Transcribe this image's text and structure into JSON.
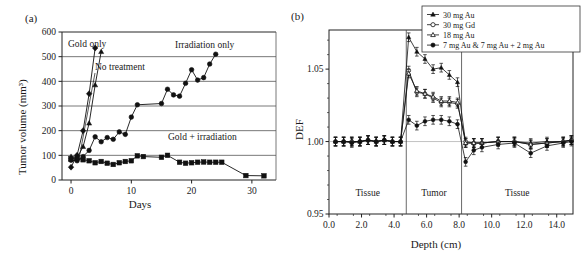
{
  "figure": {
    "panels": [
      {
        "label": "(a)",
        "xlabel": "Days",
        "ylabel": "Tumor volume (mm³)",
        "annotations": [
          "Gold only",
          "No treatment",
          "Irradiation only",
          "Gold + irradiation"
        ]
      },
      {
        "label": "(b)",
        "xlabel": "Depth (cm)",
        "ylabel": "DEF",
        "regions": [
          "Tissue",
          "Tumor",
          "Tissue"
        ],
        "legend": [
          "30 mg Au",
          "30 mg Gd",
          "18 mg Au",
          "7 mg Au & 7 mg Au + 2 mg Au"
        ]
      }
    ]
  },
  "chart_data": [
    {
      "type": "line",
      "panel": "(a)",
      "title": "",
      "xlabel": "Days",
      "ylabel": "Tumor volume (mm³)",
      "xlim": [
        -1.5,
        34
      ],
      "ylim": [
        0,
        600
      ],
      "xticks": [
        0,
        10,
        20,
        30
      ],
      "yticks": [
        0,
        100,
        200,
        300,
        400,
        500,
        600
      ],
      "grid": "horizontal",
      "series": [
        {
          "name": "Gold only",
          "marker": "filled-diamond",
          "x": [
            0,
            1,
            2,
            3,
            4
          ],
          "y": [
            52,
            100,
            200,
            350,
            535
          ]
        },
        {
          "name": "No treatment",
          "marker": "filled-triangle",
          "x": [
            0,
            1,
            2,
            3,
            4,
            5
          ],
          "y": [
            95,
            90,
            135,
            230,
            385,
            520
          ]
        },
        {
          "name": "Irradiation only",
          "marker": "filled-circle",
          "x": [
            0,
            1,
            2,
            3,
            4,
            5,
            6,
            7,
            8,
            9,
            10,
            11,
            15,
            16,
            17,
            18,
            19,
            20,
            21,
            22,
            23,
            24
          ],
          "y": [
            80,
            78,
            95,
            120,
            175,
            155,
            172,
            165,
            195,
            185,
            255,
            305,
            310,
            368,
            345,
            340,
            392,
            447,
            405,
            415,
            470,
            510
          ]
        },
        {
          "name": "Gold + irradiation",
          "marker": "filled-square",
          "x": [
            0,
            1,
            2,
            3,
            4,
            5,
            6,
            7,
            8,
            9,
            10,
            11,
            12,
            15,
            16,
            18,
            19,
            20,
            21,
            22,
            23,
            24,
            25,
            29,
            32
          ],
          "y": [
            85,
            88,
            82,
            78,
            70,
            75,
            68,
            63,
            70,
            75,
            78,
            98,
            95,
            92,
            100,
            72,
            68,
            70,
            72,
            73,
            72,
            72,
            72,
            18,
            17
          ]
        }
      ]
    },
    {
      "type": "line",
      "panel": "(b)",
      "title": "",
      "xlabel": "Depth (cm)",
      "ylabel": "DEF",
      "xlim": [
        0,
        15
      ],
      "ylim": [
        0.95,
        1.077
      ],
      "xticks": [
        0.0,
        2.0,
        4.0,
        6.0,
        8.0,
        10.0,
        12.0,
        14.0
      ],
      "yticks": [
        0.95,
        1.0,
        1.05
      ],
      "ytick_labels": [
        "0.95",
        "1.00",
        "1.05"
      ],
      "grid": "none",
      "tumor_region": [
        4.75,
        8.15
      ],
      "regions": [
        {
          "name": "Tissue",
          "range": [
            0.0,
            4.75
          ]
        },
        {
          "name": "Tumor",
          "range": [
            4.75,
            8.15
          ]
        },
        {
          "name": "Tissue",
          "range": [
            8.15,
            15.0
          ]
        }
      ],
      "series": [
        {
          "name": "30 mg Au",
          "marker": "filled-triangle",
          "x": [
            0.4,
            0.9,
            1.4,
            1.9,
            2.4,
            2.9,
            3.4,
            3.9,
            4.4,
            4.9,
            5.4,
            5.9,
            6.4,
            6.9,
            7.4,
            7.9,
            8.4,
            8.9,
            9.4,
            10.4,
            11.4,
            12.4,
            13.4,
            14.4,
            14.9
          ],
          "y": [
            1.0,
            1.0,
            1.0,
            1.0,
            1.001,
            1.0,
            1.001,
            1.0,
            1.0,
            1.072,
            1.062,
            1.057,
            1.05,
            1.051,
            1.046,
            1.041,
            0.999,
            0.999,
            0.999,
            1.0,
            1.0,
            0.999,
            1.0,
            1.0,
            1.001
          ],
          "error": 0.003
        },
        {
          "name": "30 mg Gd",
          "marker": "open-circle",
          "x": [
            0.4,
            0.9,
            1.4,
            1.9,
            2.4,
            2.9,
            3.4,
            3.9,
            4.4,
            4.9,
            5.4,
            5.9,
            6.4,
            6.9,
            7.4,
            7.9,
            8.4,
            8.9,
            9.4,
            10.4,
            11.4,
            12.4,
            13.4,
            14.4,
            14.9
          ],
          "y": [
            1.0,
            1.0,
            1.0,
            1.0,
            1.001,
            1.0,
            1.001,
            1.0,
            1.0,
            1.049,
            1.034,
            1.033,
            1.03,
            1.027,
            1.027,
            1.026,
            1.0,
            0.999,
            0.999,
            1.0,
            1.0,
            0.998,
            0.999,
            1.0,
            1.001
          ],
          "error": 0.003
        },
        {
          "name": "18 mg Au",
          "marker": "open-triangle",
          "x": [
            0.4,
            0.9,
            1.4,
            1.9,
            2.4,
            2.9,
            3.4,
            3.9,
            4.4,
            4.9,
            5.4,
            5.9,
            6.4,
            6.9,
            7.4,
            7.9,
            8.4,
            8.9,
            9.4,
            10.4,
            11.4,
            12.4,
            13.4,
            14.4,
            14.9
          ],
          "y": [
            1.0,
            1.0,
            1.0,
            1.0,
            1.001,
            1.0,
            1.001,
            1.0,
            1.0,
            1.047,
            1.035,
            1.033,
            1.031,
            1.028,
            1.028,
            1.027,
            0.999,
            0.999,
            0.999,
            1.0,
            1.0,
            0.998,
            0.999,
            1.0,
            1.001
          ],
          "error": 0.003
        },
        {
          "name": "7 mg Au & 7 mg Au + 2 mg Au",
          "marker": "filled-circle",
          "x": [
            0.4,
            0.9,
            1.4,
            1.9,
            2.4,
            2.9,
            3.4,
            3.9,
            4.4,
            4.9,
            5.4,
            5.9,
            6.4,
            6.9,
            7.4,
            7.9,
            8.4,
            8.9,
            9.4,
            10.4,
            11.4,
            12.4,
            13.4,
            14.4,
            14.9
          ],
          "y": [
            1.0,
            1.0,
            0.999,
            1.0,
            1.001,
            1.0,
            1.001,
            1.0,
            1.0,
            1.015,
            1.011,
            1.014,
            1.015,
            1.015,
            1.014,
            1.012,
            0.986,
            0.994,
            0.996,
            0.998,
            0.999,
            0.992,
            0.997,
            0.999,
            1.0
          ],
          "error": 0.003
        }
      ]
    }
  ]
}
